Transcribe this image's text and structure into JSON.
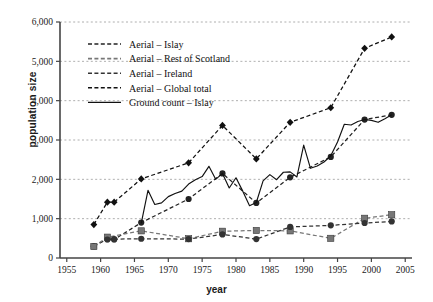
{
  "chart_data": {
    "type": "line",
    "title": "",
    "xlabel": "year",
    "ylabel": "population size",
    "xlim": [
      1954,
      2006
    ],
    "ylim": [
      0,
      6000
    ],
    "xticks": [
      1955,
      1960,
      1965,
      1970,
      1975,
      1980,
      1985,
      1990,
      1995,
      2000,
      2005
    ],
    "xticklabels": [
      "1955",
      "1960",
      "1965",
      "1970",
      "1975",
      "1980",
      "1985",
      "1990",
      "1995",
      "2000",
      "2005"
    ],
    "yticks": [
      0,
      1000,
      2000,
      3000,
      4000,
      5000,
      6000
    ],
    "yticklabels": [
      "0",
      "1,000",
      "2,000",
      "3,000",
      "4,000",
      "5,000",
      "6,000"
    ],
    "grid": "horizontal-dashed",
    "legend_position": "upper-left-inside",
    "series": [
      {
        "name": "Aerial – Islay",
        "style": "dashed",
        "marker": "circle",
        "color": "#222222",
        "points": [
          {
            "x": 1959,
            "y": 300
          },
          {
            "x": 1961,
            "y": 480
          },
          {
            "x": 1962,
            "y": 470
          },
          {
            "x": 1966,
            "y": 900
          },
          {
            "x": 1973,
            "y": 1500
          },
          {
            "x": 1978,
            "y": 2150
          },
          {
            "x": 1983,
            "y": 1400
          },
          {
            "x": 1988,
            "y": 2050
          },
          {
            "x": 1994,
            "y": 2570
          },
          {
            "x": 1999,
            "y": 3520
          },
          {
            "x": 2003,
            "y": 3640
          }
        ]
      },
      {
        "name": "Aerial – Rest of Scotland",
        "style": "dashed",
        "marker": "square",
        "color": "#777777",
        "points": [
          {
            "x": 1959,
            "y": 290
          },
          {
            "x": 1961,
            "y": 530
          },
          {
            "x": 1966,
            "y": 690
          },
          {
            "x": 1973,
            "y": 490
          },
          {
            "x": 1978,
            "y": 680
          },
          {
            "x": 1983,
            "y": 700
          },
          {
            "x": 1988,
            "y": 690
          },
          {
            "x": 1994,
            "y": 500
          },
          {
            "x": 1999,
            "y": 1010
          },
          {
            "x": 2003,
            "y": 1100
          }
        ]
      },
      {
        "name": "Aerial – Ireland",
        "style": "dashed",
        "marker": "circle",
        "color": "#333333",
        "points": [
          {
            "x": 1961,
            "y": 470
          },
          {
            "x": 1962,
            "y": 480
          },
          {
            "x": 1966,
            "y": 490
          },
          {
            "x": 1973,
            "y": 480
          },
          {
            "x": 1978,
            "y": 600
          },
          {
            "x": 1983,
            "y": 480
          },
          {
            "x": 1988,
            "y": 790
          },
          {
            "x": 1994,
            "y": 830
          },
          {
            "x": 1999,
            "y": 890
          },
          {
            "x": 2003,
            "y": 930
          }
        ]
      },
      {
        "name": "Aerial – Global total",
        "style": "dashed",
        "marker": "diamond",
        "color": "#111111",
        "points": [
          {
            "x": 1959,
            "y": 850
          },
          {
            "x": 1961,
            "y": 1420
          },
          {
            "x": 1962,
            "y": 1420
          },
          {
            "x": 1966,
            "y": 2010
          },
          {
            "x": 1973,
            "y": 2420
          },
          {
            "x": 1978,
            "y": 3370
          },
          {
            "x": 1983,
            "y": 2520
          },
          {
            "x": 1988,
            "y": 3450
          },
          {
            "x": 1994,
            "y": 3820
          },
          {
            "x": 1999,
            "y": 5330
          },
          {
            "x": 2003,
            "y": 5620
          }
        ]
      },
      {
        "name": "Ground count – Islay",
        "style": "solid",
        "marker": "none",
        "color": "#111111",
        "points": [
          {
            "x": 1966,
            "y": 880
          },
          {
            "x": 1967,
            "y": 1720
          },
          {
            "x": 1968,
            "y": 1360
          },
          {
            "x": 1969,
            "y": 1400
          },
          {
            "x": 1970,
            "y": 1560
          },
          {
            "x": 1971,
            "y": 1640
          },
          {
            "x": 1972,
            "y": 1700
          },
          {
            "x": 1973,
            "y": 1880
          },
          {
            "x": 1974,
            "y": 1990
          },
          {
            "x": 1975,
            "y": 2070
          },
          {
            "x": 1976,
            "y": 2330
          },
          {
            "x": 1977,
            "y": 2000
          },
          {
            "x": 1978,
            "y": 2150
          },
          {
            "x": 1979,
            "y": 1780
          },
          {
            "x": 1980,
            "y": 2040
          },
          {
            "x": 1981,
            "y": 1700
          },
          {
            "x": 1982,
            "y": 1330
          },
          {
            "x": 1983,
            "y": 1410
          },
          {
            "x": 1984,
            "y": 1960
          },
          {
            "x": 1985,
            "y": 2120
          },
          {
            "x": 1986,
            "y": 1990
          },
          {
            "x": 1987,
            "y": 2180
          },
          {
            "x": 1988,
            "y": 2190
          },
          {
            "x": 1989,
            "y": 2060
          },
          {
            "x": 1990,
            "y": 2870
          },
          {
            "x": 1991,
            "y": 2280
          },
          {
            "x": 1992,
            "y": 2340
          },
          {
            "x": 1993,
            "y": 2440
          },
          {
            "x": 1994,
            "y": 2600
          },
          {
            "x": 1995,
            "y": 2950
          },
          {
            "x": 1996,
            "y": 3400
          },
          {
            "x": 1997,
            "y": 3380
          },
          {
            "x": 1998,
            "y": 3470
          },
          {
            "x": 1999,
            "y": 3520
          },
          {
            "x": 2000,
            "y": 3500
          },
          {
            "x": 2001,
            "y": 3450
          },
          {
            "x": 2002,
            "y": 3540
          },
          {
            "x": 2003,
            "y": 3640
          }
        ]
      }
    ]
  }
}
